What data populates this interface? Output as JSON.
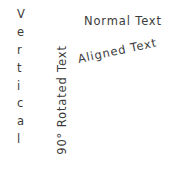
{
  "canvas": {
    "width": 179,
    "height": 180,
    "background_color": "#ffffff",
    "text_color": "#3b3b3b"
  },
  "labels": {
    "vertical_stack": {
      "full_text": "Vertical",
      "orientation": "stacked-letters-vertical",
      "chars": [
        "V",
        "e",
        "r",
        "t",
        "i",
        "c",
        "a",
        "l"
      ]
    },
    "rotated_90": {
      "text": "90° Rotated Text",
      "orientation": "rotated-90-ccw",
      "rotation_degrees": -90
    },
    "normal": {
      "text": "Normal Text",
      "orientation": "horizontal",
      "rotation_degrees": 0
    },
    "aligned": {
      "text": "Aligned Text",
      "orientation": "slanted",
      "rotation_degrees": -12
    }
  }
}
